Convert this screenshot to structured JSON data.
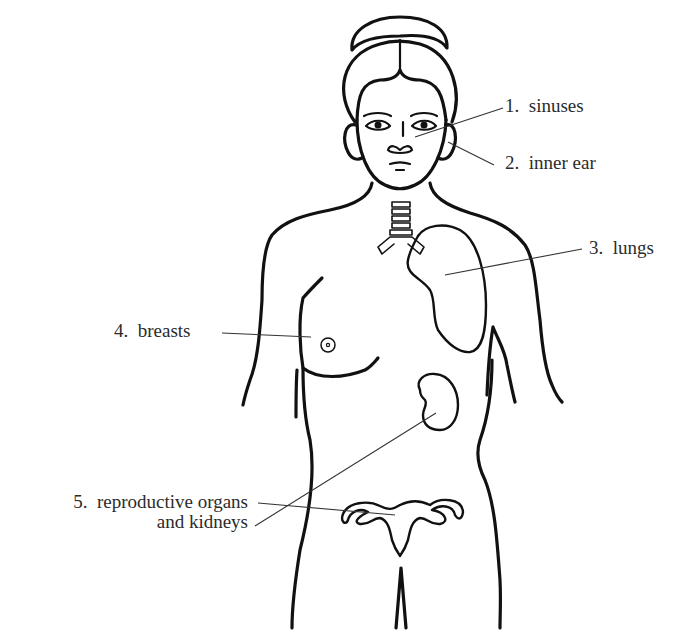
{
  "diagram": {
    "colors": {
      "ink": "#111111",
      "text": "#2b2b2b",
      "background": "#ffffff"
    },
    "labels": [
      {
        "number": "1.",
        "text": "sinuses"
      },
      {
        "number": "2.",
        "text": "inner ear"
      },
      {
        "number": "3.",
        "text": "lungs"
      },
      {
        "number": "4.",
        "text": "breasts"
      },
      {
        "number": "5.",
        "text": "reproductive organs",
        "text_line2": "and kidneys"
      }
    ]
  }
}
